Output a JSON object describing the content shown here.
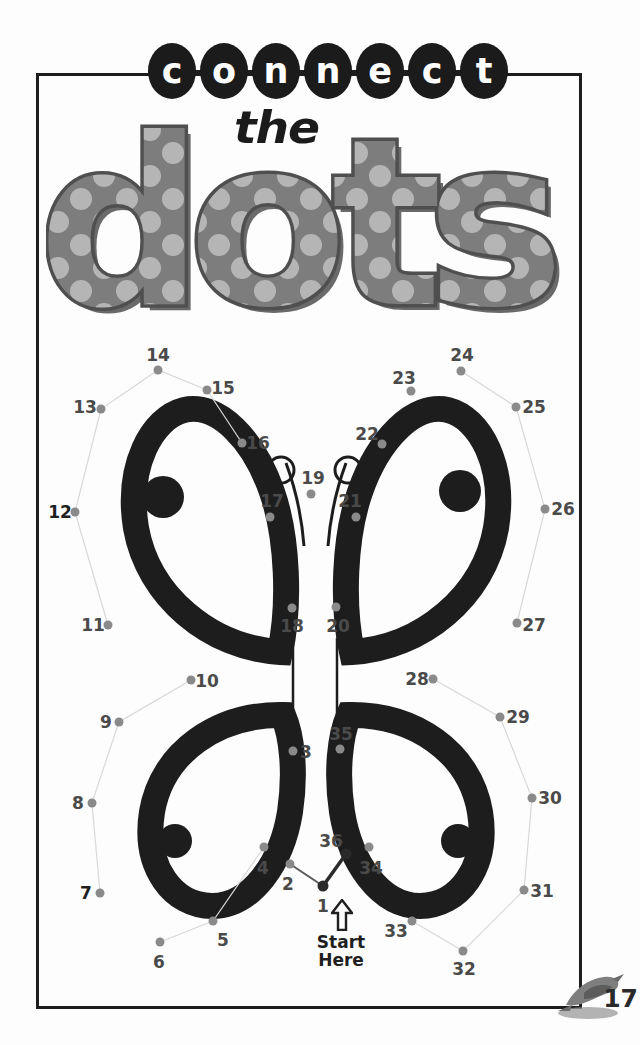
{
  "page": {
    "title_line1": "connect",
    "title_line2": "the",
    "title_line3": "dots",
    "page_number": "17",
    "colors": {
      "ink": "#1b1b1b",
      "dot_gray": "#8a8a8a",
      "letter_gray": "#7d7d7d",
      "letter_polka": "#b5b5b5",
      "paper": "#fdfdfd"
    }
  },
  "connect_letters": [
    {
      "char": "c"
    },
    {
      "char": "o"
    },
    {
      "char": "n"
    },
    {
      "char": "n"
    },
    {
      "char": "e"
    },
    {
      "char": "c"
    },
    {
      "char": "t"
    }
  ],
  "dots_letters": [
    {
      "char": "d"
    },
    {
      "char": "o"
    },
    {
      "char": "t"
    },
    {
      "char": "s"
    }
  ],
  "start": {
    "line1": "Start",
    "line2": "Here",
    "arrow": "up-arrow"
  },
  "puzzle": {
    "subject": "butterfly",
    "total_dots": 36,
    "numbers_connected_already": [
      1,
      2,
      36
    ],
    "dots": [
      {
        "n": "1",
        "x": 323,
        "y": 886,
        "lx": 323,
        "ly": 906,
        "dark": true,
        "bold": false
      },
      {
        "n": "2",
        "x": 290,
        "y": 864,
        "lx": 288,
        "ly": 884,
        "dark": false,
        "bold": false
      },
      {
        "n": "3",
        "x": 293,
        "y": 751,
        "lx": 306,
        "ly": 752,
        "dark": false,
        "bold": false
      },
      {
        "n": "4",
        "x": 264,
        "y": 847,
        "lx": 263,
        "ly": 868,
        "dark": false,
        "bold": false
      },
      {
        "n": "5",
        "x": 213,
        "y": 921,
        "lx": 223,
        "ly": 940,
        "dark": false,
        "bold": false
      },
      {
        "n": "6",
        "x": 160,
        "y": 942,
        "lx": 159,
        "ly": 962,
        "dark": false,
        "bold": false
      },
      {
        "n": "7",
        "x": 100,
        "y": 893,
        "lx": 86,
        "ly": 893,
        "dark": false,
        "bold": true
      },
      {
        "n": "8",
        "x": 92,
        "y": 803,
        "lx": 78,
        "ly": 803,
        "dark": false,
        "bold": false
      },
      {
        "n": "9",
        "x": 119,
        "y": 722,
        "lx": 106,
        "ly": 722,
        "dark": false,
        "bold": false
      },
      {
        "n": "10",
        "x": 191,
        "y": 680,
        "lx": 207,
        "ly": 681,
        "dark": false,
        "bold": false
      },
      {
        "n": "11",
        "x": 108,
        "y": 625,
        "lx": 93,
        "ly": 625,
        "dark": false,
        "bold": false
      },
      {
        "n": "12",
        "x": 75,
        "y": 512,
        "lx": 60,
        "ly": 512,
        "dark": false,
        "bold": true
      },
      {
        "n": "13",
        "x": 101,
        "y": 409,
        "lx": 85,
        "ly": 407,
        "dark": false,
        "bold": false
      },
      {
        "n": "14",
        "x": 158,
        "y": 370,
        "lx": 158,
        "ly": 355,
        "dark": false,
        "bold": false
      },
      {
        "n": "15",
        "x": 207,
        "y": 390,
        "lx": 223,
        "ly": 388,
        "dark": false,
        "bold": false
      },
      {
        "n": "16",
        "x": 242,
        "y": 443,
        "lx": 258,
        "ly": 443,
        "dark": false,
        "bold": false
      },
      {
        "n": "17",
        "x": 270,
        "y": 517,
        "lx": 272,
        "ly": 501,
        "dark": false,
        "bold": false
      },
      {
        "n": "18",
        "x": 292,
        "y": 608,
        "lx": 292,
        "ly": 626,
        "dark": false,
        "bold": false
      },
      {
        "n": "19",
        "x": 311,
        "y": 494,
        "lx": 313,
        "ly": 478,
        "dark": false,
        "bold": false
      },
      {
        "n": "20",
        "x": 336,
        "y": 607,
        "lx": 338,
        "ly": 626,
        "dark": false,
        "bold": false
      },
      {
        "n": "21",
        "x": 356,
        "y": 517,
        "lx": 350,
        "ly": 501,
        "dark": false,
        "bold": false
      },
      {
        "n": "22",
        "x": 382,
        "y": 444,
        "lx": 367,
        "ly": 434,
        "dark": false,
        "bold": false
      },
      {
        "n": "23",
        "x": 411,
        "y": 391,
        "lx": 404,
        "ly": 378,
        "dark": false,
        "bold": false
      },
      {
        "n": "24",
        "x": 461,
        "y": 371,
        "lx": 462,
        "ly": 355,
        "dark": false,
        "bold": false
      },
      {
        "n": "25",
        "x": 516,
        "y": 407,
        "lx": 534,
        "ly": 407,
        "dark": false,
        "bold": false
      },
      {
        "n": "26",
        "x": 545,
        "y": 509,
        "lx": 563,
        "ly": 509,
        "dark": false,
        "bold": false
      },
      {
        "n": "27",
        "x": 517,
        "y": 623,
        "lx": 534,
        "ly": 625,
        "dark": false,
        "bold": false
      },
      {
        "n": "28",
        "x": 433,
        "y": 679,
        "lx": 417,
        "ly": 679,
        "dark": false,
        "bold": false
      },
      {
        "n": "29",
        "x": 500,
        "y": 717,
        "lx": 518,
        "ly": 717,
        "dark": false,
        "bold": false
      },
      {
        "n": "30",
        "x": 532,
        "y": 798,
        "lx": 550,
        "ly": 798,
        "dark": false,
        "bold": false
      },
      {
        "n": "31",
        "x": 524,
        "y": 890,
        "lx": 542,
        "ly": 891,
        "dark": false,
        "bold": false
      },
      {
        "n": "32",
        "x": 463,
        "y": 951,
        "lx": 464,
        "ly": 969,
        "dark": false,
        "bold": false
      },
      {
        "n": "33",
        "x": 412,
        "y": 921,
        "lx": 396,
        "ly": 931,
        "dark": false,
        "bold": false
      },
      {
        "n": "34",
        "x": 369,
        "y": 847,
        "lx": 371,
        "ly": 868,
        "dark": false,
        "bold": false
      },
      {
        "n": "35",
        "x": 340,
        "y": 749,
        "lx": 341,
        "ly": 734,
        "dark": false,
        "bold": false
      },
      {
        "n": "36",
        "x": 346,
        "y": 854,
        "lx": 331,
        "ly": 841,
        "dark": true,
        "bold": false
      }
    ]
  }
}
